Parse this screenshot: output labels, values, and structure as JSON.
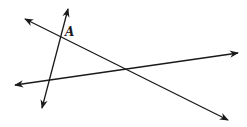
{
  "diagram": {
    "type": "three intersecting lines",
    "stroke_color": "#1a1a1a",
    "lines": [
      {
        "name": "line-steep",
        "x1": 42,
        "y1": 108,
        "x2": 68,
        "y2": 9
      },
      {
        "name": "line-descending",
        "x1": 25,
        "y1": 19,
        "x2": 228,
        "y2": 120
      },
      {
        "name": "line-ascending",
        "x1": 15,
        "y1": 85,
        "x2": 238,
        "y2": 53
      }
    ],
    "labels": [
      {
        "text": "A",
        "x": 65,
        "y": 36
      }
    ]
  }
}
